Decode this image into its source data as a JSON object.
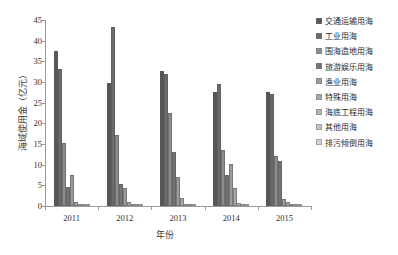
{
  "chart_data": {
    "type": "bar",
    "title": "",
    "xlabel": "年份",
    "ylabel": "海域使用金（亿元）",
    "categories": [
      "2011",
      "2012",
      "2013",
      "2014",
      "2015"
    ],
    "ylim": [
      0,
      45
    ],
    "yticks": [
      0,
      5,
      10,
      15,
      20,
      25,
      30,
      35,
      40,
      45
    ],
    "grid": false,
    "legend_position": "right",
    "series": [
      {
        "name": "交通运输用海",
        "color": "#565656",
        "values": [
          37.5,
          29.8,
          32.7,
          27.5,
          27.5
        ]
      },
      {
        "name": "工业用海",
        "color": "#6a6a6a",
        "values": [
          33.1,
          43.3,
          32.0,
          29.5,
          27.2
        ]
      },
      {
        "name": "围海造地用海",
        "color": "#8d8d8d",
        "values": [
          15.3,
          17.3,
          22.5,
          13.5,
          12.0
        ]
      },
      {
        "name": "旅游娱乐用海",
        "color": "#747474",
        "values": [
          4.6,
          5.3,
          13.0,
          7.5,
          11.0
        ]
      },
      {
        "name": "渔业用海",
        "color": "#9b9b9b",
        "values": [
          7.6,
          4.4,
          7.0,
          10.2,
          1.8
        ]
      },
      {
        "name": "特殊用海",
        "color": "#a8a8a8",
        "values": [
          0.9,
          0.9,
          2.0,
          4.4,
          1.0
        ]
      },
      {
        "name": "海底工程用海",
        "color": "#b5b5b5",
        "values": [
          0.5,
          0.6,
          0.6,
          0.8,
          0.6
        ]
      },
      {
        "name": "其他用海",
        "color": "#c4c4c4",
        "values": [
          0.4,
          0.5,
          0.4,
          0.5,
          0.4
        ]
      },
      {
        "name": "排污倾倒用海",
        "color": "#d2d2d2",
        "values": [
          0.2,
          0.2,
          0.2,
          0.2,
          0.2
        ]
      }
    ]
  },
  "axis": {
    "y_title": "海域使用金（亿元）",
    "x_title": "年份"
  }
}
